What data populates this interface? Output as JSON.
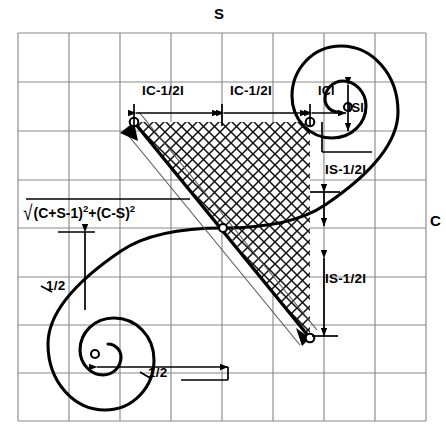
{
  "figure": {
    "type": "cornu-spiral-diagram",
    "axes": {
      "top_label": "S",
      "right_label": "C"
    },
    "grid": {
      "columns": 8,
      "rows": 8,
      "cell_px": 51,
      "left": 18,
      "top": 33,
      "right": 426,
      "bottom": 421,
      "line_color": "#888888"
    },
    "colors": {
      "ink": "#000000",
      "grid": "#8a8a8a",
      "hatch": "#1a1a1a"
    },
    "annotations": {
      "c_minus_half_left": "IC-1/2I",
      "c_minus_half_right": "IC-1/2I",
      "abs_c": "ICI",
      "abs_s": "ISI",
      "s_minus_half_upper": "IS-1/2I",
      "s_minus_half_lower": "IS-1/2I",
      "half_upper": "1/2",
      "half_lower": "1/2"
    },
    "formula": {
      "radical": "√",
      "body_a": "(C+S-1)",
      "exp_a": "2",
      "plus": "+",
      "body_b": "(C-S)",
      "exp_b": "2"
    },
    "spiral": {
      "eye_upper_right": {
        "cx": 348,
        "cy": 107,
        "outer_r": 46,
        "inner_r": 25
      },
      "eye_lower_left": {
        "cx": 95,
        "cy": 354,
        "outer_r": 46,
        "inner_r": 25
      }
    },
    "hatched_region": {
      "vertices": [
        [
          134,
          122
        ],
        [
          310,
          122
        ],
        [
          310,
          338
        ],
        [
          223,
          228
        ]
      ],
      "label": "cross-hatched quadrilateral"
    }
  }
}
